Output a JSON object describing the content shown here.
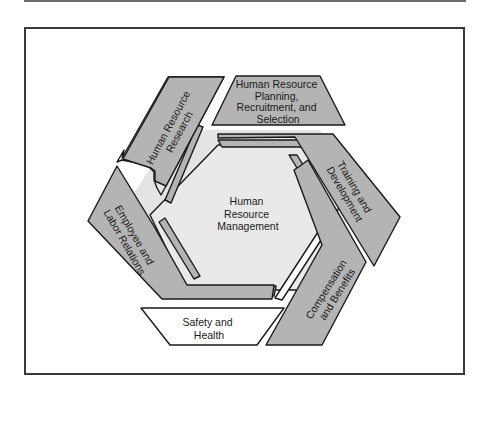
{
  "diagram": {
    "center": {
      "lines": [
        "Human",
        "Resource",
        "Management"
      ]
    },
    "segments": [
      {
        "id": "hr-research",
        "lines": [
          "Human Resource",
          "Research"
        ],
        "shade": "gray"
      },
      {
        "id": "hr-planning",
        "lines": [
          "Human Resource",
          "Planning,",
          "Recruitment, and",
          "Selection"
        ],
        "shade": "gray"
      },
      {
        "id": "training",
        "lines": [
          "Training and",
          "Development"
        ],
        "shade": "gray"
      },
      {
        "id": "compensation",
        "lines": [
          "Compensation",
          "and Benefits"
        ],
        "shade": "gray"
      },
      {
        "id": "safety",
        "lines": [
          "Safety and",
          "Health"
        ],
        "shade": "white"
      },
      {
        "id": "employee-relations",
        "lines": [
          "Employee and",
          "Labor Relations"
        ],
        "shade": "gray"
      }
    ],
    "colors": {
      "gray_fill": "#b4b4b4",
      "light_band": "#e4e4e4",
      "center_fill": "#e9e9e9",
      "white_fill": "#ffffff",
      "outline": "#1a1a1a"
    }
  }
}
